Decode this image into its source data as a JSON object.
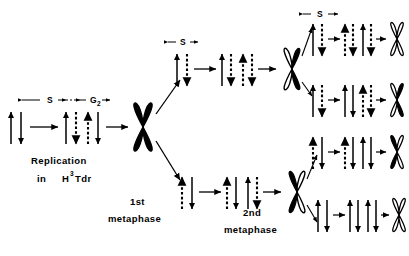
{
  "figure": {
    "type": "diagram",
    "background_color": "#ffffff",
    "ink_color": "#000000"
  },
  "labels": {
    "phase_s_1": "S",
    "phase_g2": "G",
    "phase_g2_sub": "2",
    "phase_s_branch_top": "S",
    "phase_s_branch_far": "S",
    "replication_line1": "Replication",
    "replication_in": "in",
    "tracer_h": "H",
    "tracer_sup": "3",
    "tracer_tdr": "Tdr",
    "metaphase1_line1": "1st",
    "metaphase1_line2": "metaphase",
    "metaphase2_line1": "2nd",
    "metaphase2_line2": "metaphase"
  },
  "strand_legend": {
    "solid": "labeled strand (H3Tdr incorporated)",
    "dashed": "newly synthesized / tracer-free strand"
  },
  "stages": {
    "start": {
      "name": "unreplicated-dna-pair",
      "strands": [
        "solid",
        "solid"
      ]
    },
    "after_s1": {
      "name": "replicated-dna-labeled",
      "strands": [
        "solid",
        "dashed",
        "dashed",
        "solid"
      ]
    },
    "metaphase1": {
      "name": "first-metaphase-chromosome",
      "fill": "both-chromatids-labeled"
    },
    "branch_top_s": {
      "name": "top-branch-after-s",
      "strands_before": [
        "solid",
        "dashed"
      ],
      "strands_after": [
        "solid",
        "dashed",
        "dashed",
        "dashed"
      ]
    },
    "branch_bottom_s": {
      "name": "bottom-branch-after-s",
      "strands_before": [
        "dashed",
        "solid"
      ],
      "strands_after": [
        "dashed",
        "solid",
        "solid",
        "dashed"
      ]
    },
    "metaphase2_top": {
      "name": "second-metaphase-chromosome-top",
      "fill": "one-chromatid-labeled"
    },
    "metaphase2_bottom": {
      "name": "second-metaphase-chromosome-bottom",
      "fill": "one-chromatid-labeled"
    },
    "final": [
      {
        "name": "final-chromosome-1",
        "fill": "unlabeled",
        "strands": [
          "solid",
          "dashed",
          "dashed",
          "dashed"
        ]
      },
      {
        "name": "final-chromosome-2",
        "fill": "half-labeled-right",
        "strands": [
          "solid",
          "dashed",
          "dashed",
          "solid"
        ]
      },
      {
        "name": "final-chromosome-3",
        "fill": "half-labeled-left",
        "strands": [
          "dashed",
          "solid",
          "solid",
          "dashed"
        ]
      },
      {
        "name": "final-chromosome-4",
        "fill": "unlabeled",
        "strands": [
          "solid",
          "dashed",
          "dashed",
          "solid"
        ]
      }
    ]
  }
}
